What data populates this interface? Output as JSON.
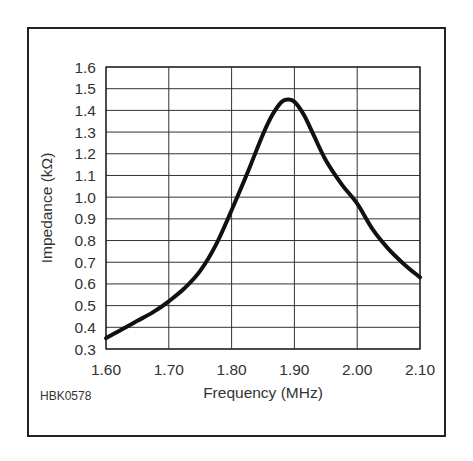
{
  "figure_code": "HBK0578",
  "chart_data": {
    "type": "line",
    "title": "",
    "xlabel": "Frequency (MHz)",
    "ylabel": "Impedance (kΩ)",
    "xlim": [
      1.6,
      2.1
    ],
    "ylim": [
      0.3,
      1.6
    ],
    "x_ticks": [
      "1.60",
      "1.70",
      "1.80",
      "1.90",
      "2.00",
      "2.10"
    ],
    "y_ticks": [
      "0.3",
      "0.4",
      "0.5",
      "0.6",
      "0.7",
      "0.8",
      "0.9",
      "1.0",
      "1.1",
      "1.2",
      "1.3",
      "1.4",
      "1.5",
      "1.6"
    ],
    "grid": true,
    "legend": null,
    "series": [
      {
        "name": "Impedance",
        "x": [
          1.6,
          1.625,
          1.65,
          1.675,
          1.7,
          1.725,
          1.75,
          1.775,
          1.8,
          1.825,
          1.85,
          1.865,
          1.88,
          1.89,
          1.9,
          1.915,
          1.93,
          1.95,
          1.975,
          2.0,
          2.025,
          2.05,
          2.075,
          2.1
        ],
        "values": [
          0.35,
          0.39,
          0.43,
          0.47,
          0.52,
          0.58,
          0.66,
          0.78,
          0.94,
          1.11,
          1.29,
          1.38,
          1.44,
          1.45,
          1.44,
          1.38,
          1.29,
          1.17,
          1.06,
          0.97,
          0.85,
          0.76,
          0.69,
          0.63
        ]
      }
    ]
  }
}
